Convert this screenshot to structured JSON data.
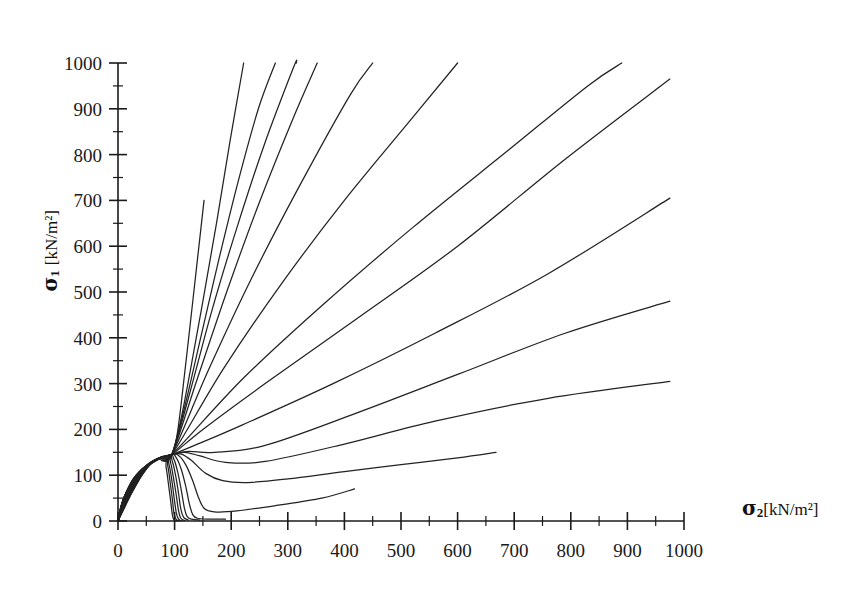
{
  "figure": {
    "title": "",
    "background_color": "#ffffff",
    "line_color": "#222222",
    "axis_color": "#1a1a1a"
  },
  "axes": {
    "y": {
      "symbol": "σ",
      "subscript": "1",
      "unit": "[kN/m²]",
      "label_full": "σ1 [kN/m²]",
      "ticks": [
        0,
        100,
        200,
        300,
        400,
        500,
        600,
        700,
        800,
        900,
        1000
      ],
      "tick_labels": [
        "0",
        "100",
        "200",
        "300",
        "400",
        "500",
        "600",
        "700",
        "800",
        "900",
        "1000"
      ],
      "min": 0,
      "max": 1000,
      "minor_tick_interval": 50
    },
    "x": {
      "symbol": "σ",
      "subscript": "2",
      "unit": "[kN/m²]",
      "label_full": "σ2[kN/m²]",
      "ticks": [
        0,
        100,
        200,
        300,
        400,
        500,
        600,
        700,
        800,
        900,
        1000
      ],
      "tick_labels": [
        "0",
        "100",
        "200",
        "300",
        "400",
        "500",
        "600",
        "700",
        "800",
        "900",
        "1000"
      ],
      "min": 0,
      "max": 1000,
      "minor_tick_interval": 50
    }
  },
  "chart_data": {
    "type": "line",
    "title": "",
    "xlabel": "σ2[kN/m²]",
    "ylabel": "σ1 [kN/m²]",
    "xlim": [
      0,
      1000
    ],
    "ylim": [
      0,
      1000
    ],
    "grid": false,
    "legend": "none",
    "annotations": [
      {
        "text": "node",
        "x": 95,
        "y": 145,
        "description": "common convergence point of all stress paths"
      }
    ],
    "series": [
      {
        "name": "path-1",
        "points": [
          [
            0,
            0
          ],
          [
            12,
            30
          ],
          [
            26,
            65
          ],
          [
            44,
            103
          ],
          [
            62,
            130
          ],
          [
            80,
            141
          ],
          [
            95,
            145
          ],
          [
            104,
            185
          ],
          [
            112,
            260
          ],
          [
            124,
            390
          ],
          [
            138,
            545
          ],
          [
            152,
            700
          ]
        ]
      },
      {
        "name": "path-2",
        "points": [
          [
            0,
            0
          ],
          [
            10,
            28
          ],
          [
            24,
            62
          ],
          [
            42,
            100
          ],
          [
            60,
            128
          ],
          [
            79,
            141
          ],
          [
            95,
            145
          ],
          [
            110,
            215
          ],
          [
            128,
            330
          ],
          [
            150,
            480
          ],
          [
            174,
            650
          ],
          [
            198,
            830
          ],
          [
            222,
            1000
          ]
        ]
      },
      {
        "name": "path-3",
        "points": [
          [
            0,
            0
          ],
          [
            9,
            26
          ],
          [
            22,
            58
          ],
          [
            40,
            97
          ],
          [
            59,
            126
          ],
          [
            78,
            140
          ],
          [
            95,
            145
          ],
          [
            118,
            250
          ],
          [
            146,
            400
          ],
          [
            178,
            570
          ],
          [
            212,
            740
          ],
          [
            248,
            900
          ],
          [
            278,
            1000
          ]
        ]
      },
      {
        "name": "path-4",
        "points": [
          [
            0,
            0
          ],
          [
            8,
            24
          ],
          [
            20,
            55
          ],
          [
            38,
            94
          ],
          [
            57,
            124
          ],
          [
            77,
            140
          ],
          [
            95,
            145
          ],
          [
            128,
            285
          ],
          [
            166,
            460
          ],
          [
            210,
            640
          ],
          [
            258,
            820
          ],
          [
            310,
            990
          ],
          [
            315,
            1000
          ]
        ]
      },
      {
        "name": "path-5",
        "points": [
          [
            0,
            0
          ],
          [
            7,
            22
          ],
          [
            18,
            52
          ],
          [
            36,
            91
          ],
          [
            55,
            122
          ],
          [
            76,
            139
          ],
          [
            95,
            145
          ],
          [
            140,
            310
          ],
          [
            192,
            500
          ],
          [
            248,
            690
          ],
          [
            308,
            875
          ],
          [
            352,
            1000
          ]
        ]
      },
      {
        "name": "path-6",
        "points": [
          [
            0,
            0
          ],
          [
            6,
            20
          ],
          [
            16,
            48
          ],
          [
            33,
            88
          ],
          [
            53,
            120
          ],
          [
            75,
            139
          ],
          [
            95,
            145
          ],
          [
            160,
            330
          ],
          [
            236,
            530
          ],
          [
            320,
            730
          ],
          [
            410,
            930
          ],
          [
            450,
            1000
          ]
        ]
      },
      {
        "name": "path-7",
        "points": [
          [
            0,
            0
          ],
          [
            5,
            18
          ],
          [
            14,
            44
          ],
          [
            30,
            84
          ],
          [
            50,
            117
          ],
          [
            73,
            138
          ],
          [
            95,
            145
          ],
          [
            185,
            330
          ],
          [
            290,
            520
          ],
          [
            400,
            700
          ],
          [
            520,
            880
          ],
          [
            600,
            1000
          ]
        ]
      },
      {
        "name": "path-8",
        "points": [
          [
            0,
            0
          ],
          [
            4,
            16
          ],
          [
            12,
            40
          ],
          [
            27,
            80
          ],
          [
            47,
            114
          ],
          [
            71,
            137
          ],
          [
            95,
            145
          ],
          [
            220,
            310
          ],
          [
            360,
            470
          ],
          [
            520,
            640
          ],
          [
            690,
            810
          ],
          [
            830,
            950
          ],
          [
            890,
            1000
          ]
        ]
      },
      {
        "name": "path-9",
        "points": [
          [
            0,
            0
          ],
          [
            3,
            14
          ],
          [
            10,
            36
          ],
          [
            24,
            75
          ],
          [
            44,
            110
          ],
          [
            69,
            136
          ],
          [
            95,
            145
          ],
          [
            150,
            200
          ],
          [
            260,
            300
          ],
          [
            420,
            440
          ],
          [
            600,
            600
          ],
          [
            790,
            790
          ],
          [
            975,
            965
          ]
        ]
      },
      {
        "name": "path-10",
        "points": [
          [
            0,
            0
          ],
          [
            2,
            12
          ],
          [
            8,
            32
          ],
          [
            20,
            68
          ],
          [
            40,
            105
          ],
          [
            66,
            134
          ],
          [
            95,
            145
          ],
          [
            135,
            165
          ],
          [
            220,
            210
          ],
          [
            380,
            300
          ],
          [
            560,
            410
          ],
          [
            760,
            540
          ],
          [
            975,
            705
          ]
        ]
      },
      {
        "name": "path-11",
        "points": [
          [
            0,
            0
          ],
          [
            2,
            10
          ],
          [
            6,
            28
          ],
          [
            17,
            62
          ],
          [
            36,
            100
          ],
          [
            63,
            132
          ],
          [
            95,
            145
          ],
          [
            125,
            152
          ],
          [
            170,
            150
          ],
          [
            260,
            165
          ],
          [
            420,
            235
          ],
          [
            600,
            320
          ],
          [
            790,
            410
          ],
          [
            975,
            480
          ]
        ]
      },
      {
        "name": "path-12",
        "points": [
          [
            0,
            0
          ],
          [
            1,
            8
          ],
          [
            5,
            24
          ],
          [
            14,
            56
          ],
          [
            32,
            94
          ],
          [
            60,
            130
          ],
          [
            95,
            145
          ],
          [
            118,
            150
          ],
          [
            145,
            142
          ],
          [
            190,
            128
          ],
          [
            260,
            130
          ],
          [
            400,
            168
          ],
          [
            560,
            218
          ],
          [
            760,
            268
          ],
          [
            975,
            305
          ]
        ]
      },
      {
        "name": "path-13",
        "points": [
          [
            0,
            0
          ],
          [
            1,
            6
          ],
          [
            4,
            20
          ],
          [
            11,
            50
          ],
          [
            28,
            88
          ],
          [
            57,
            128
          ],
          [
            95,
            145
          ],
          [
            112,
            146
          ],
          [
            130,
            132
          ],
          [
            155,
            104
          ],
          [
            185,
            88
          ],
          [
            230,
            84
          ],
          [
            300,
            92
          ],
          [
            400,
            108
          ],
          [
            500,
            123
          ],
          [
            600,
            138
          ],
          [
            668,
            150
          ]
        ]
      },
      {
        "name": "path-14",
        "points": [
          [
            0,
            0
          ],
          [
            1,
            5
          ],
          [
            3,
            17
          ],
          [
            9,
            45
          ],
          [
            24,
            82
          ],
          [
            53,
            124
          ],
          [
            95,
            145
          ],
          [
            108,
            142
          ],
          [
            120,
            122
          ],
          [
            132,
            88
          ],
          [
            142,
            52
          ],
          [
            152,
            28
          ],
          [
            170,
            20
          ],
          [
            210,
            22
          ],
          [
            280,
            34
          ],
          [
            360,
            50
          ],
          [
            418,
            70
          ]
        ]
      },
      {
        "name": "path-15",
        "points": [
          [
            0,
            0
          ],
          [
            1,
            4
          ],
          [
            3,
            15
          ],
          [
            8,
            41
          ],
          [
            21,
            77
          ],
          [
            50,
            121
          ],
          [
            92,
            145
          ],
          [
            103,
            138
          ],
          [
            112,
            112
          ],
          [
            120,
            74
          ],
          [
            126,
            38
          ],
          [
            132,
            14
          ],
          [
            140,
            6
          ],
          [
            160,
            4
          ],
          [
            190,
            4
          ]
        ]
      },
      {
        "name": "path-16",
        "points": [
          [
            0,
            0
          ],
          [
            1,
            3
          ],
          [
            2,
            13
          ],
          [
            7,
            37
          ],
          [
            19,
            72
          ],
          [
            47,
            118
          ],
          [
            90,
            144
          ],
          [
            99,
            134
          ],
          [
            106,
            104
          ],
          [
            112,
            66
          ],
          [
            117,
            30
          ],
          [
            122,
            10
          ],
          [
            130,
            4
          ],
          [
            145,
            2
          ]
        ]
      },
      {
        "name": "path-17",
        "points": [
          [
            0,
            0
          ],
          [
            1,
            3
          ],
          [
            2,
            11
          ],
          [
            6,
            34
          ],
          [
            17,
            68
          ],
          [
            44,
            115
          ],
          [
            88,
            143
          ],
          [
            96,
            130
          ],
          [
            102,
            98
          ],
          [
            107,
            60
          ],
          [
            111,
            26
          ],
          [
            116,
            8
          ],
          [
            124,
            2
          ]
        ]
      },
      {
        "name": "path-18",
        "points": [
          [
            0,
            0
          ],
          [
            1,
            2
          ],
          [
            2,
            10
          ],
          [
            5,
            31
          ],
          [
            15,
            64
          ],
          [
            41,
            112
          ],
          [
            86,
            142
          ],
          [
            93,
            127
          ],
          [
            98,
            94
          ],
          [
            103,
            56
          ],
          [
            107,
            22
          ],
          [
            111,
            6
          ],
          [
            118,
            1
          ]
        ]
      },
      {
        "name": "path-19",
        "points": [
          [
            0,
            0
          ],
          [
            1,
            2
          ],
          [
            2,
            9
          ],
          [
            5,
            28
          ],
          [
            14,
            60
          ],
          [
            38,
            108
          ],
          [
            84,
            141
          ],
          [
            90,
            124
          ],
          [
            95,
            90
          ],
          [
            99,
            52
          ],
          [
            103,
            18
          ],
          [
            107,
            4
          ],
          [
            113,
            0
          ]
        ]
      },
      {
        "name": "path-20",
        "points": [
          [
            0,
            0
          ],
          [
            1,
            2
          ],
          [
            2,
            8
          ],
          [
            4,
            26
          ],
          [
            12,
            56
          ],
          [
            35,
            104
          ],
          [
            82,
            140
          ],
          [
            88,
            120
          ],
          [
            92,
            86
          ],
          [
            96,
            48
          ],
          [
            99,
            16
          ],
          [
            103,
            3
          ],
          [
            108,
            0
          ]
        ]
      },
      {
        "name": "path-21",
        "points": [
          [
            0,
            0
          ],
          [
            1,
            1
          ],
          [
            2,
            7
          ],
          [
            4,
            24
          ],
          [
            11,
            52
          ],
          [
            32,
            100
          ],
          [
            80,
            139
          ],
          [
            85,
            117
          ],
          [
            89,
            82
          ],
          [
            93,
            44
          ],
          [
            96,
            14
          ],
          [
            99,
            2
          ],
          [
            104,
            0
          ]
        ]
      }
    ]
  }
}
